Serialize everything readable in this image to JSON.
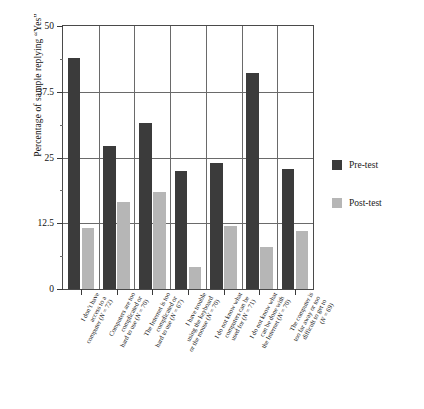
{
  "chart_data": {
    "type": "bar",
    "title": "",
    "xlabel": "",
    "ylabel": "Percentage of sample replying “Yes”",
    "ylim": [
      0,
      50
    ],
    "yticks": [
      0,
      12.5,
      25,
      37.5,
      50
    ],
    "ytick_labels": [
      "0",
      "12.5",
      "25",
      "37.5",
      "50"
    ],
    "grid": true,
    "legend_position": "right",
    "categories": [
      "I don’t have access to a computer (N = 72)",
      "Computers are too complicated or hard to use (N = 70)",
      "The Internet is too complicated or hard to use (N = 67)",
      "I have trouble using the keyboard or the mouse (N = 70)",
      "I do not know what computers can be used for (N = 71)",
      "I do not know what can be done with the Internet (N = 70)",
      "The computer is too far away or too difficult to get to (N = 69)"
    ],
    "category_lines": [
      [
        "I don’t have",
        "access to a",
        "computer (N = 72)"
      ],
      [
        "Computers are too",
        "complicated or",
        "hard to use (N = 70)"
      ],
      [
        "The Internet is too",
        "complicated or",
        "hard to use (N = 67)"
      ],
      [
        "I have trouble",
        "using the keyboard",
        "or the mouse (N = 70)"
      ],
      [
        "I do not know what",
        "computers can be",
        "used for (N = 71)"
      ],
      [
        "I do not know what",
        "can be done with",
        "the Internet (N = 70)"
      ],
      [
        "The computer is",
        "too far away or too",
        "difficult to get to",
        "(N = 69)"
      ]
    ],
    "series": [
      {
        "name": "Pre-test",
        "color": "#3b3b3b",
        "values": [
          44.0,
          27.2,
          31.5,
          22.5,
          24.0,
          41.0,
          22.8
        ]
      },
      {
        "name": "Post-test",
        "color": "#b6b6b6",
        "values": [
          11.6,
          16.5,
          18.5,
          4.2,
          12.0,
          8.0,
          11.0
        ]
      }
    ]
  },
  "legend": {
    "items": [
      {
        "label": "Pre-test",
        "color": "#3b3b3b"
      },
      {
        "label": "Post-test",
        "color": "#b6b6b6"
      }
    ]
  }
}
